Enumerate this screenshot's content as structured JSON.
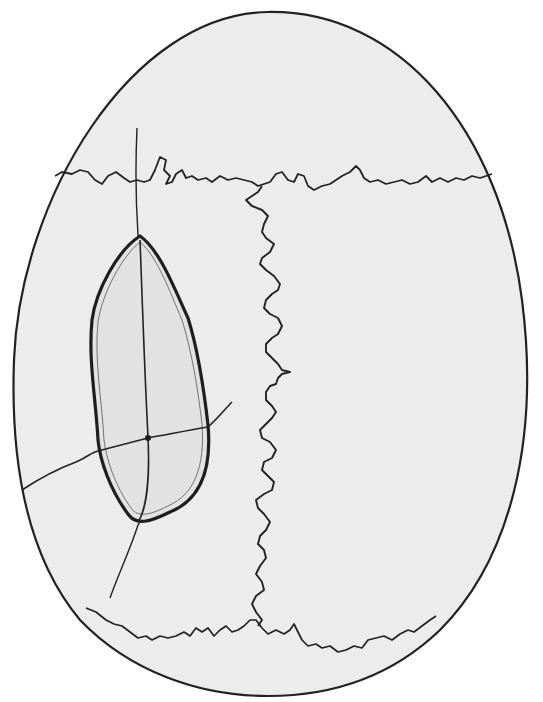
{
  "figure": {
    "type": "anatomical line drawing",
    "colors": {
      "background": "#ffffff",
      "skull_fill": "#ececec",
      "outlined_region_fill": "#e2e2e2",
      "line": "#1e1e1e"
    },
    "elements": [
      {
        "name": "skull-outline",
        "shape": "egg-shaped oval"
      },
      {
        "name": "upper-transverse-suture",
        "shape": "serrated horizontal line"
      },
      {
        "name": "median-suture",
        "shape": "serrated vertical line"
      },
      {
        "name": "lower-transverse-suture",
        "shape": "serrated horizontal line"
      },
      {
        "name": "outlined-region",
        "shape": "elongated oval with double border"
      },
      {
        "name": "vertical-fine-line",
        "shape": "thin line crossing outlined region"
      },
      {
        "name": "oblique-fine-line",
        "shape": "thin line crossing outlined region"
      }
    ]
  }
}
